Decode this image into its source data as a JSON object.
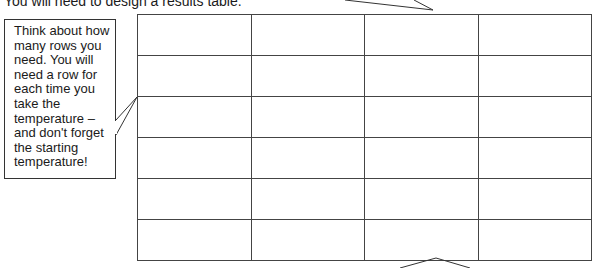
{
  "instruction": {
    "text": "You will need to design a results table."
  },
  "callout": {
    "text": "Think about how many rows you need. You will need a row for each time you take the temperature – and don't forget the starting temperature!"
  },
  "results_table": {
    "columns": 4,
    "rows": [
      [
        "",
        "",
        "",
        ""
      ],
      [
        "",
        "",
        "",
        ""
      ],
      [
        "",
        "",
        "",
        ""
      ],
      [
        "",
        "",
        "",
        ""
      ],
      [
        "",
        "",
        "",
        ""
      ],
      [
        "",
        "",
        "",
        ""
      ]
    ]
  },
  "colors": {
    "line": "#444444",
    "text": "#1a1a1a",
    "background": "#ffffff"
  }
}
